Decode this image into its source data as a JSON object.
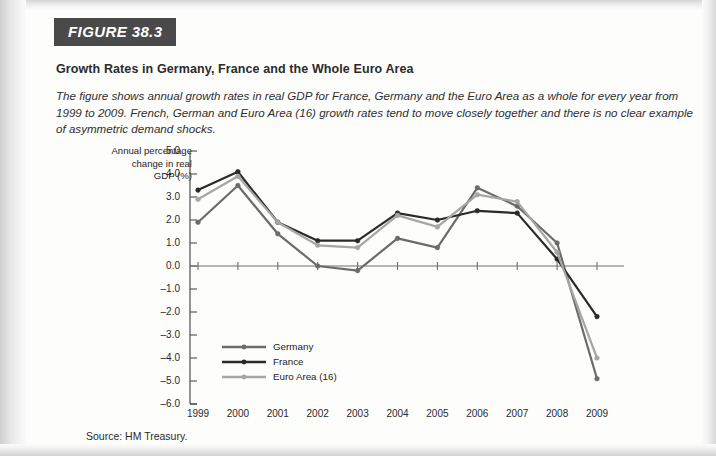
{
  "figure": {
    "tag": "FIGURE 38.3",
    "title": "Growth Rates in Germany, France and the Whole Euro Area",
    "description": "The figure shows annual growth rates in real GDP for France, Germany and the Euro Area as a whole for every year from 1999 to 2009. French, German and Euro Area (16) growth rates tend to move closely together and there is no clear example of asymmetric demand shocks.",
    "source": "Source: HM Treasury."
  },
  "chart_data": {
    "type": "line",
    "title": "Growth Rates in Germany, France and the Whole Euro Area",
    "xlabel": "",
    "ylabel": "Annual percentage change in real GDP (%)",
    "ylabel_lines": [
      "Annual percentage",
      "change in real",
      "GDP (%)"
    ],
    "categories": [
      "1999",
      "2000",
      "2001",
      "2002",
      "2003",
      "2004",
      "2005",
      "2006",
      "2007",
      "2008",
      "2009"
    ],
    "ylim": [
      -6.0,
      5.0
    ],
    "yticks": [
      "5.0",
      "4.0",
      "3.0",
      "2.0",
      "1.0",
      "0.0",
      "-1.0",
      "-2.0",
      "-3.0",
      "-4.0",
      "-5.0",
      "-6.0"
    ],
    "ytick_values": [
      5.0,
      4.0,
      3.0,
      2.0,
      1.0,
      0.0,
      -1.0,
      -2.0,
      -3.0,
      -4.0,
      -5.0,
      -6.0
    ],
    "grid": false,
    "legend_position": "inside-lower-left",
    "series": [
      {
        "name": "Germany",
        "color": "#6b6b6b",
        "values": [
          1.9,
          3.5,
          1.4,
          0.0,
          -0.2,
          1.2,
          0.8,
          3.4,
          2.6,
          1.0,
          -4.9
        ]
      },
      {
        "name": "France",
        "color": "#2a2a2a",
        "values": [
          3.3,
          4.1,
          1.9,
          1.1,
          1.1,
          2.3,
          2.0,
          2.4,
          2.3,
          0.3,
          -2.2
        ]
      },
      {
        "name": "Euro Area (16)",
        "color": "#a6a6a6",
        "values": [
          2.9,
          3.9,
          1.9,
          0.9,
          0.8,
          2.2,
          1.7,
          3.1,
          2.8,
          0.6,
          -4.0
        ]
      }
    ]
  }
}
